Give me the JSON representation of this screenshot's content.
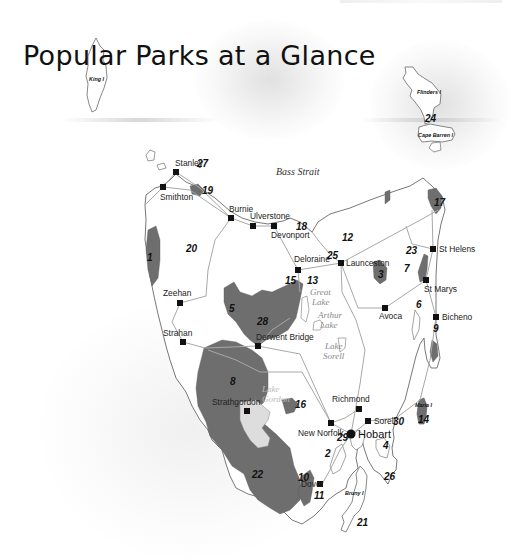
{
  "page": {
    "title": "Popular Parks at a Glance"
  },
  "colors": {
    "park_fill": "#6e6e6e",
    "land_fill": "#ffffff",
    "coast_stroke": "#555555",
    "road_stroke": "#a8a8a8",
    "lake_fill": "#dddddd",
    "town_marker": "#111111"
  },
  "map": {
    "water_labels": {
      "strait": "Bass Strait",
      "great_lake": [
        "Great",
        "Lake"
      ],
      "arthur_lake": [
        "Arthur",
        "Lake"
      ],
      "lake_sorell": [
        "Lake",
        "Sorell"
      ],
      "lake_gordon": [
        "Lake",
        "Gordon"
      ]
    },
    "islands": {
      "king": "King I",
      "flinders": "Flinders I",
      "cape_barren": "Cape Barren I",
      "maria": "Maria I",
      "bruny": "Bruny I"
    },
    "towns": [
      {
        "name": "Stanley",
        "x": 176,
        "y": 172
      },
      {
        "name": "Smithton",
        "x": 163,
        "y": 187
      },
      {
        "name": "Burnie",
        "x": 231,
        "y": 218
      },
      {
        "name": "Ulverstone",
        "x": 253,
        "y": 226
      },
      {
        "name": "Devonport",
        "x": 274,
        "y": 226
      },
      {
        "name": "Deloraine",
        "x": 298,
        "y": 270
      },
      {
        "name": "Launceston",
        "x": 341,
        "y": 263
      },
      {
        "name": "St Helens",
        "x": 433,
        "y": 249
      },
      {
        "name": "St Marys",
        "x": 426,
        "y": 280
      },
      {
        "name": "Avoca",
        "x": 385,
        "y": 308
      },
      {
        "name": "Bicheno",
        "x": 436,
        "y": 317
      },
      {
        "name": "Zeehan",
        "x": 180,
        "y": 303
      },
      {
        "name": "Strahan",
        "x": 183,
        "y": 342
      },
      {
        "name": "Derwent Bridge",
        "x": 258,
        "y": 346
      },
      {
        "name": "Strathgordon",
        "x": 247,
        "y": 411
      },
      {
        "name": "Richmond",
        "x": 359,
        "y": 409
      },
      {
        "name": "New Norfolk",
        "x": 331,
        "y": 423
      },
      {
        "name": "Sorell",
        "x": 368,
        "y": 421
      },
      {
        "name": "Dover",
        "x": 320,
        "y": 484
      }
    ],
    "capital": {
      "name": "Hobart",
      "x": 351,
      "y": 434
    },
    "parks": [
      {
        "id": "1",
        "x": 147,
        "y": 258
      },
      {
        "id": "2",
        "x": 325,
        "y": 454
      },
      {
        "id": "3",
        "x": 380,
        "y": 274
      },
      {
        "id": "4",
        "x": 384,
        "y": 446
      },
      {
        "id": "5",
        "x": 230,
        "y": 309
      },
      {
        "id": "6",
        "x": 417,
        "y": 305
      },
      {
        "id": "7",
        "x": 405,
        "y": 269
      },
      {
        "id": "8",
        "x": 231,
        "y": 382
      },
      {
        "id": "9",
        "x": 434,
        "y": 329
      },
      {
        "id": "10",
        "x": 300,
        "y": 478
      },
      {
        "id": "11",
        "x": 316,
        "y": 496
      },
      {
        "id": "12",
        "x": 344,
        "y": 238
      },
      {
        "id": "13",
        "x": 308,
        "y": 281
      },
      {
        "id": "14",
        "x": 419,
        "y": 420
      },
      {
        "id": "15",
        "x": 287,
        "y": 281
      },
      {
        "id": "16",
        "x": 296,
        "y": 405
      },
      {
        "id": "17",
        "x": 436,
        "y": 203
      },
      {
        "id": "18",
        "x": 297,
        "y": 227
      },
      {
        "id": "19",
        "x": 203,
        "y": 191
      },
      {
        "id": "20",
        "x": 188,
        "y": 249
      },
      {
        "id": "21",
        "x": 358,
        "y": 523
      },
      {
        "id": "22",
        "x": 254,
        "y": 475
      },
      {
        "id": "23",
        "x": 408,
        "y": 251
      },
      {
        "id": "24",
        "x": 427,
        "y": 119
      },
      {
        "id": "25",
        "x": 328,
        "y": 256
      },
      {
        "id": "26",
        "x": 385,
        "y": 477
      },
      {
        "id": "27",
        "x": 197,
        "y": 166
      },
      {
        "id": "28",
        "x": 258,
        "y": 322
      },
      {
        "id": "29",
        "x": 339,
        "y": 438
      },
      {
        "id": "30",
        "x": 393,
        "y": 422
      }
    ]
  }
}
